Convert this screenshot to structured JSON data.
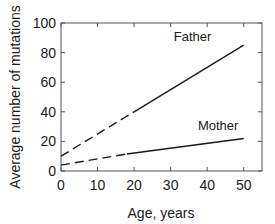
{
  "chart_data": {
    "type": "line",
    "title": "",
    "xlabel": "Age, years",
    "ylabel": "Average number of mutations",
    "xlim": [
      0,
      55
    ],
    "ylim": [
      0,
      100
    ],
    "xticks": [
      0,
      10,
      20,
      30,
      40,
      50
    ],
    "yticks": [
      0,
      20,
      40,
      60,
      80,
      100
    ],
    "xtick_labels": [
      "0",
      "10",
      "20",
      "30",
      "40",
      "50"
    ],
    "ytick_labels": [
      "0",
      "20",
      "40",
      "60",
      "80",
      "100"
    ],
    "grid": false,
    "legend": "inline labels",
    "series": [
      {
        "name": "Father",
        "x": [
          0,
          20,
          50
        ],
        "values": [
          10,
          40,
          85
        ],
        "extrapolated_range": [
          0,
          20
        ],
        "style": "dashed for extrapolated segment, solid for observed",
        "label_position": {
          "x": 36,
          "y": 88
        }
      },
      {
        "name": "Mother",
        "x": [
          0,
          18,
          50
        ],
        "values": [
          4,
          11.5,
          22
        ],
        "extrapolated_range": [
          0,
          18
        ],
        "style": "dashed for extrapolated segment, solid for observed",
        "label_position": {
          "x": 43,
          "y": 28
        }
      }
    ]
  },
  "labels": {
    "xlabel": "Age, years",
    "ylabel": "Average number of mutations",
    "father": "Father",
    "mother": "Mother"
  }
}
